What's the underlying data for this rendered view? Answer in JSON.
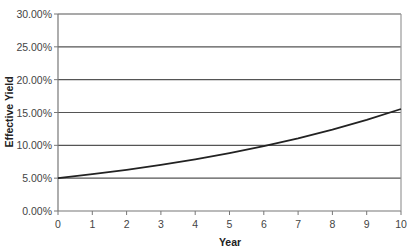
{
  "chart_data": {
    "type": "line",
    "title": "",
    "xlabel": "Year",
    "ylabel": "Effective Yield",
    "x": [
      0,
      1,
      2,
      3,
      4,
      5,
      6,
      7,
      8,
      9,
      10
    ],
    "series": [
      {
        "name": "Effective Yield",
        "values": [
          5.0,
          5.6,
          6.27,
          7.02,
          7.87,
          8.81,
          9.87,
          11.05,
          12.38,
          13.87,
          15.53
        ]
      }
    ],
    "xlim": [
      0,
      10
    ],
    "ylim": [
      0,
      30
    ],
    "x_tick_labels": [
      "0",
      "1",
      "2",
      "3",
      "4",
      "5",
      "6",
      "7",
      "8",
      "9",
      "10"
    ],
    "y_tick_labels": [
      "0.00%",
      "5.00%",
      "10.00%",
      "15.00%",
      "20.00%",
      "25.00%",
      "30.00%"
    ],
    "y_ticks": [
      0,
      5,
      10,
      15,
      20,
      25,
      30
    ],
    "grid": {
      "horizontal": true,
      "vertical": false
    },
    "legend": null,
    "colors": {
      "line": "#222222",
      "grid": "#555555",
      "axis": "#777777"
    }
  }
}
